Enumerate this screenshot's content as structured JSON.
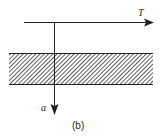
{
  "diagram": {
    "horizontal_axis_label": "T",
    "vertical_axis_label": "a",
    "caption": "(b)",
    "colors": {
      "line": "#222222",
      "hatch": "#333333",
      "background": "#ffffff"
    }
  }
}
